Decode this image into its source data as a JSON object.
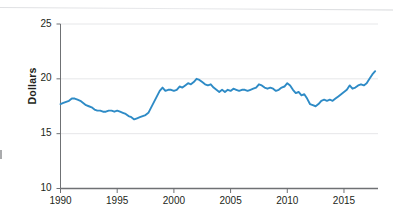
{
  "chart_data": {
    "type": "line",
    "title": "",
    "subtitle": "",
    "xlabel": "",
    "ylabel": "Dollars",
    "xlim": [
      1990,
      2018
    ],
    "ylim": [
      10,
      25
    ],
    "ytick_labels": [
      "10",
      "15",
      "20",
      "25"
    ],
    "yticks": [
      10,
      15,
      20,
      25
    ],
    "xtick_labels": [
      "1990",
      "1995",
      "2000",
      "2005",
      "2010",
      "2015"
    ],
    "xticks": [
      1990,
      1995,
      2000,
      2005,
      2010,
      2015
    ],
    "grid": "horizontal",
    "legend": "none",
    "line_color": "#2E8BC6",
    "grid_color": "#e6e7e9",
    "axis_color": "#6f7174",
    "series": [
      {
        "name": "Dollars",
        "x": [
          1990.0,
          1990.25,
          1990.5,
          1990.75,
          1991.0,
          1991.25,
          1991.5,
          1991.75,
          1992.0,
          1992.25,
          1992.5,
          1992.75,
          1993.0,
          1993.25,
          1993.5,
          1993.75,
          1994.0,
          1994.25,
          1994.5,
          1994.75,
          1995.0,
          1995.25,
          1995.5,
          1995.75,
          1996.0,
          1996.25,
          1996.5,
          1996.75,
          1997.0,
          1997.25,
          1997.5,
          1997.75,
          1998.0,
          1998.25,
          1998.5,
          1998.75,
          1999.0,
          1999.25,
          1999.5,
          1999.75,
          2000.0,
          2000.25,
          2000.5,
          2000.75,
          2001.0,
          2001.25,
          2001.5,
          2001.75,
          2002.0,
          2002.25,
          2002.5,
          2002.75,
          2003.0,
          2003.25,
          2003.5,
          2003.75,
          2004.0,
          2004.25,
          2004.5,
          2004.75,
          2005.0,
          2005.25,
          2005.5,
          2005.75,
          2006.0,
          2006.25,
          2006.5,
          2006.75,
          2007.0,
          2007.25,
          2007.5,
          2007.75,
          2008.0,
          2008.25,
          2008.5,
          2008.75,
          2009.0,
          2009.25,
          2009.5,
          2009.75,
          2010.0,
          2010.25,
          2010.5,
          2010.75,
          2011.0,
          2011.25,
          2011.5,
          2011.75,
          2012.0,
          2012.25,
          2012.5,
          2012.75,
          2013.0,
          2013.25,
          2013.5,
          2013.75,
          2014.0,
          2014.25,
          2014.5,
          2014.75,
          2015.0,
          2015.25,
          2015.5,
          2015.75,
          2016.0,
          2016.25,
          2016.5,
          2016.75,
          2017.0,
          2017.25,
          2017.5,
          2017.75
        ],
        "values": [
          17.7,
          17.8,
          17.9,
          18.0,
          18.2,
          18.2,
          18.1,
          18.0,
          17.8,
          17.6,
          17.5,
          17.4,
          17.2,
          17.1,
          17.1,
          17.0,
          17.0,
          17.1,
          17.1,
          17.0,
          17.1,
          17.0,
          16.9,
          16.8,
          16.6,
          16.5,
          16.3,
          16.4,
          16.5,
          16.6,
          16.7,
          16.9,
          17.4,
          17.9,
          18.4,
          18.9,
          19.2,
          18.9,
          19.0,
          19.0,
          18.9,
          19.0,
          19.3,
          19.2,
          19.4,
          19.6,
          19.5,
          19.7,
          20.0,
          19.9,
          19.7,
          19.5,
          19.4,
          19.5,
          19.2,
          19.0,
          18.8,
          19.0,
          18.8,
          19.0,
          18.9,
          19.1,
          19.0,
          18.9,
          19.0,
          19.0,
          18.9,
          19.0,
          19.1,
          19.2,
          19.5,
          19.4,
          19.2,
          19.1,
          19.2,
          19.1,
          18.9,
          19.0,
          19.2,
          19.3,
          19.6,
          19.4,
          19.0,
          18.7,
          18.8,
          18.5,
          18.6,
          18.2,
          17.7,
          17.6,
          17.5,
          17.7,
          18.0,
          18.1,
          18.0,
          18.1,
          18.0,
          18.2,
          18.4,
          18.6,
          18.8,
          19.0,
          19.4,
          19.1,
          19.2,
          19.4,
          19.5,
          19.4,
          19.6,
          20.0,
          20.4,
          20.7
        ]
      }
    ]
  },
  "axes": {
    "y_title": "Dollars"
  }
}
